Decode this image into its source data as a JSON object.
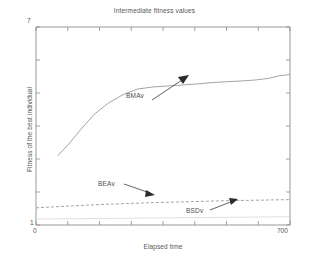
{
  "chart_data": {
    "type": "line",
    "title": "Intermediate fitness values",
    "xlabel": "Elapsed time",
    "ylabel": "Fitness of the best individual",
    "xlim": [
      0,
      700
    ],
    "ylim": [
      1,
      7
    ],
    "xticks": [
      0,
      700
    ],
    "xtick_labels": [
      "0",
      "700"
    ],
    "yticks": [
      1,
      7
    ],
    "ytick_labels": [
      "1",
      "7"
    ],
    "grid": false,
    "legend": "annotations",
    "series": [
      {
        "name": "BMAv",
        "style": "solid",
        "color": "#9a9a9a",
        "x": [
          60,
          90,
          120,
          160,
          200,
          240,
          280,
          320,
          360,
          400,
          440,
          480,
          520,
          560,
          600,
          640,
          670,
          700
        ],
        "y": [
          3.1,
          3.45,
          3.85,
          4.35,
          4.7,
          4.95,
          5.12,
          5.18,
          5.21,
          5.24,
          5.27,
          5.31,
          5.34,
          5.36,
          5.39,
          5.44,
          5.52,
          5.56
        ]
      },
      {
        "name": "BEAv",
        "style": "dashed",
        "color": "#9a9a9a",
        "x": [
          0,
          100,
          200,
          300,
          400,
          500,
          600,
          700
        ],
        "y": [
          1.52,
          1.58,
          1.63,
          1.67,
          1.7,
          1.73,
          1.75,
          1.77
        ]
      },
      {
        "name": "BSDv",
        "style": "solid-faint",
        "color": "#d0d0d0",
        "x": [
          0,
          100,
          200,
          300,
          400,
          500,
          600,
          700
        ],
        "y": [
          1.18,
          1.19,
          1.2,
          1.21,
          1.22,
          1.23,
          1.24,
          1.25
        ]
      }
    ],
    "annotations": [
      {
        "label": "BMAv",
        "arrow": "up-right"
      },
      {
        "label": "BEAv",
        "arrow": "down-right"
      },
      {
        "label": "BSDv",
        "arrow": "up-right"
      }
    ]
  },
  "chart": {
    "title": "Intermediate fitness values",
    "xlabel": "Elapsed time",
    "ylabel": "Fitness of the best individual",
    "ytick_top": "7",
    "ytick_bottom": "1",
    "xtick_left": "0",
    "xtick_right": "700",
    "labels": {
      "bmav": "BMAv",
      "beav": "BEAv",
      "bsdv": "BSDv"
    },
    "colors": {
      "axis": "#808080",
      "series_bmav": "#9a9a9a",
      "series_beav": "#9a9a9a",
      "series_bsdv": "#d0d0d0",
      "text": "#555555",
      "background": "#ffffff"
    }
  }
}
